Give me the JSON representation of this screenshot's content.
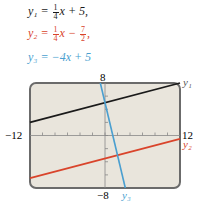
{
  "equations": [
    {
      "name": "y1",
      "lhs": "y₁ =",
      "num": "1",
      "den": "4",
      "rest": "x + 5,",
      "color": "#1a1a1a"
    },
    {
      "name": "y2",
      "lhs": "y₂ =",
      "num": "1",
      "den": "4",
      "rest_mid": "x −",
      "num2": "7",
      "den2": "2",
      "tail": ",",
      "color": "#d9442b"
    },
    {
      "name": "y3",
      "text": "y₃ = −4x + 5",
      "color": "#4a9fd0"
    }
  ],
  "axis_labels": {
    "ymax": "8",
    "ymin": "−8",
    "xmin": "−12",
    "xmax": "12"
  },
  "curve_labels": {
    "y1": "y₁",
    "y2": "y₂",
    "y3": "y₃"
  },
  "chart_data": {
    "type": "line",
    "title": "",
    "xlabel": "",
    "ylabel": "",
    "xlim": [
      -12,
      12
    ],
    "ylim": [
      -8,
      8
    ],
    "xticks_step": 2,
    "yticks_step": 2,
    "grid": false,
    "series": [
      {
        "name": "y1 = (1/4)x + 5",
        "slope": 0.25,
        "intercept": 5,
        "color": "#1a1a1a",
        "x": [
          -12,
          12
        ],
        "y": [
          2,
          8
        ]
      },
      {
        "name": "y2 = (1/4)x - 7/2",
        "slope": 0.25,
        "intercept": -3.5,
        "color": "#d9442b",
        "x": [
          -12,
          12
        ],
        "y": [
          -6.5,
          -0.5
        ]
      },
      {
        "name": "y3 = -4x + 5",
        "slope": -4,
        "intercept": 5,
        "color": "#4a9fd0",
        "x": [
          -0.75,
          3.25
        ],
        "y": [
          8,
          -8
        ]
      }
    ],
    "background": "#e9e5dc",
    "frame_color": "#6b6b6b"
  }
}
